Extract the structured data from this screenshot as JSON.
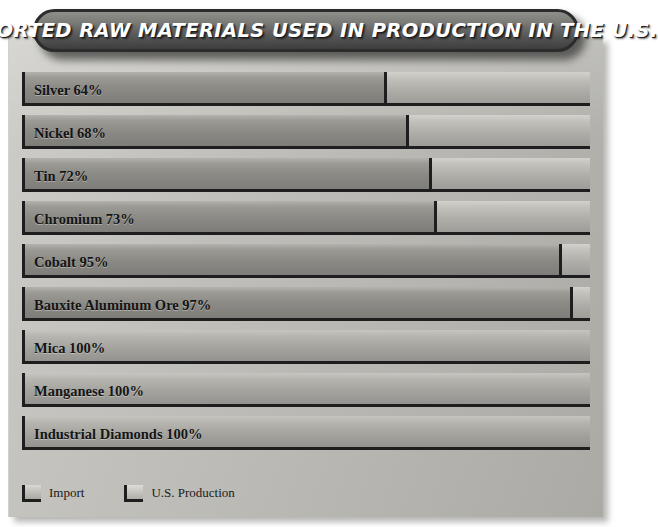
{
  "header": {
    "title": "IMPORTED RAW MATERIALS USED IN PRODUCTION IN THE U.S."
  },
  "legend": {
    "items": [
      {
        "label": "Import",
        "swatch": "import-swatch"
      },
      {
        "label": "U.S. Production",
        "swatch": "us-production-swatch"
      }
    ]
  },
  "chart_data": {
    "type": "bar",
    "title": "IMPORTED RAW MATERIALS USED IN PRODUCTION IN THE U.S.",
    "orientation": "horizontal",
    "stacked": true,
    "xlabel": "",
    "ylabel": "",
    "xlim": [
      0,
      100
    ],
    "grid": false,
    "legend_position": "bottom-left",
    "categories": [
      "Silver",
      "Nickel",
      "Tin",
      "Chromium",
      "Cobalt",
      "Bauxite Aluminum Ore",
      "Mica",
      "Manganese",
      "Industrial Diamonds"
    ],
    "series": [
      {
        "name": "Import",
        "values": [
          64,
          68,
          72,
          73,
          95,
          97,
          100,
          100,
          100
        ]
      },
      {
        "name": "U.S. Production",
        "values": [
          36,
          32,
          28,
          27,
          5,
          3,
          0,
          0,
          0
        ]
      }
    ],
    "bars": [
      {
        "label": "Silver 64%",
        "name": "Silver",
        "import": 64,
        "production": 36
      },
      {
        "label": "Nickel 68%",
        "name": "Nickel",
        "import": 68,
        "production": 32
      },
      {
        "label": "Tin 72%",
        "name": "Tin",
        "import": 72,
        "production": 28
      },
      {
        "label": "Chromium 73%",
        "name": "Chromium",
        "import": 73,
        "production": 27
      },
      {
        "label": "Cobalt 95%",
        "name": "Cobalt",
        "import": 95,
        "production": 5
      },
      {
        "label": "Bauxite Aluminum Ore 97%",
        "name": "Bauxite Aluminum Ore",
        "import": 97,
        "production": 3
      },
      {
        "label": "Mica 100%",
        "name": "Mica",
        "import": 100,
        "production": 0
      },
      {
        "label": "Manganese 100%",
        "name": "Manganese",
        "import": 100,
        "production": 0
      },
      {
        "label": "Industrial Diamonds 100%",
        "name": "Industrial Diamonds",
        "import": 100,
        "production": 0
      }
    ]
  },
  "colors": {
    "panel": "#bfbeb9",
    "title_bar_dark": "#3e3e3f",
    "title_text": "#ffffff",
    "import_bar": "#8a8984",
    "production_bar": "#c2c1bc",
    "outline": "#1e1e1e"
  }
}
